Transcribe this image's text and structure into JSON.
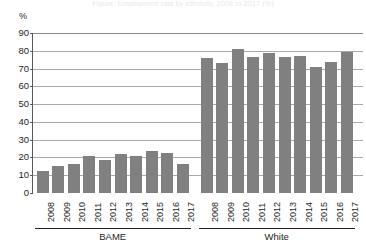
{
  "figure": {
    "title_sliver": "Figure: Employment rate by ethnicity, 2008 to 2017 (%)",
    "y_unit_label": "%",
    "bar_color": "#808080",
    "gridline_color": "#8a8a8a",
    "axis_color": "#58595b",
    "text_color": "#231f20"
  },
  "chart_data": {
    "type": "bar",
    "title": "",
    "subtitle": "",
    "xlabel": "",
    "ylabel": "%",
    "ylim": [
      0,
      90
    ],
    "ytick_step": 10,
    "yticks": [
      0,
      10,
      20,
      30,
      40,
      50,
      60,
      70,
      80,
      90
    ],
    "ytick_labels": [
      "0",
      "10",
      "20",
      "30",
      "40",
      "50",
      "60",
      "70",
      "80",
      "90"
    ],
    "grid": true,
    "grid_axis": "y",
    "legend": false,
    "legend_position": "none",
    "orientation": "vertical",
    "group_label_key": "group",
    "groups": [
      {
        "group": "BAME",
        "categories": [
          "2008",
          "2009",
          "2010",
          "2011",
          "2012",
          "2013",
          "2014",
          "2015",
          "2016",
          "2017"
        ],
        "values": [
          12.5,
          15.3,
          16.4,
          20.7,
          18.8,
          21.7,
          20.7,
          23.8,
          22.4,
          16.6
        ]
      },
      {
        "group": "White",
        "categories": [
          "2008",
          "2009",
          "2010",
          "2011",
          "2012",
          "2013",
          "2014",
          "2015",
          "2016",
          "2017"
        ],
        "values": [
          75.8,
          73.0,
          81.0,
          76.6,
          78.7,
          76.3,
          76.9,
          70.8,
          73.8,
          79.4
        ]
      }
    ],
    "annotations": []
  }
}
